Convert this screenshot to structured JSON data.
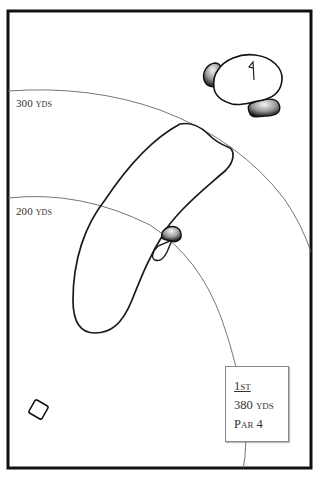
{
  "hole": {
    "number_label": "1st",
    "yardage_label": "380 yds",
    "par_label": "Par 4"
  },
  "distance_markers": [
    {
      "label": "300 yds",
      "yards": 300
    },
    {
      "label": "200 yds",
      "yards": 200
    }
  ],
  "features": {
    "green": {
      "has_flag": true,
      "greenside_bunkers": 2
    },
    "fairway_bunkers": 1,
    "tee_box": true
  },
  "colors": {
    "border": "#111111",
    "outline": "#1a1a1a",
    "arc": "#666666",
    "background": "#ffffff"
  }
}
